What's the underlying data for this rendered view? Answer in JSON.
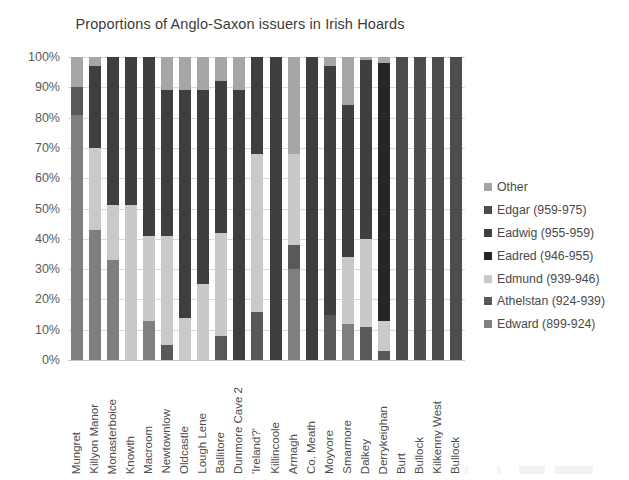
{
  "chart_data": {
    "type": "bar",
    "stacked": true,
    "normalized": "100%",
    "title": "Proportions of Anglo-Saxon issuers in Irish Hoards",
    "xlabel": "",
    "ylabel": "",
    "ylim": [
      0,
      100
    ],
    "ytick_labels": [
      "0%",
      "10%",
      "20%",
      "30%",
      "40%",
      "50%",
      "60%",
      "70%",
      "80%",
      "90%",
      "100%"
    ],
    "ytick_values": [
      0,
      10,
      20,
      30,
      40,
      50,
      60,
      70,
      80,
      90,
      100
    ],
    "grid": true,
    "legend_position": "right",
    "stack_order_bottom_to_top": [
      "Edward (899-924)",
      "Athelstan (924-939)",
      "Edmund (939-946)",
      "Eadred (946-955)",
      "Eadwig (955-959)",
      "Edgar (959-975)",
      "Other"
    ],
    "categories": [
      "Mungret",
      "Killyon Manor",
      "Monasterboice",
      "Knowth",
      "Macroom",
      "Newtownlow",
      "Oldcastle",
      "Lough Lene",
      "Ballitore",
      "Dunmore Cave 2",
      "'Ireland?'",
      "Killincoole",
      "Armagh",
      "Co. Meath",
      "Moyvore",
      "Smarmore",
      "Dalkey",
      "Derrykeighan",
      "Burt",
      "Bullock",
      "Kilkenny West",
      "Bullock"
    ],
    "categories_plotted": [
      "Mungret",
      "Killyon Manor",
      "Monasterboice",
      "Knowth",
      "Macroom",
      "Newtownlow",
      "Oldcastle",
      "Lough Lene",
      "Ballitore",
      "Dunmore Cave 2",
      "'Ireland?'",
      "Killincoole",
      "Armagh",
      "Co. Meath",
      "Moyvore",
      "Smarmore",
      "Dalkey",
      "Derrykeighan",
      "Burt",
      "Bullock",
      "Kilkenny West",
      "Bullock"
    ],
    "series": [
      {
        "name": "Edward (899-924)",
        "color": "#7f7f7f",
        "values": [
          81,
          43,
          33,
          0,
          13,
          0,
          0,
          0,
          0,
          0,
          0,
          0,
          30,
          0,
          0,
          12,
          0,
          0,
          0,
          0,
          0,
          0
        ]
      },
      {
        "name": "Athelstan (924-939)",
        "color": "#595959",
        "values": [
          9,
          0,
          0,
          0,
          0,
          5,
          0,
          0,
          8,
          0,
          16,
          0,
          8,
          0,
          15,
          0,
          11,
          3,
          0,
          0,
          0,
          0
        ]
      },
      {
        "name": "Edmund (939-946)",
        "color": "#c9c9c9",
        "values": [
          0,
          27,
          18,
          51,
          28,
          36,
          14,
          25,
          34,
          0,
          52,
          0,
          30,
          0,
          0,
          22,
          29,
          10,
          0,
          0,
          0,
          0
        ]
      },
      {
        "name": "Eadred (946-955)",
        "color": "#262626",
        "values": [
          0,
          0,
          0,
          0,
          0,
          0,
          0,
          0,
          0,
          0,
          0,
          0,
          0,
          0,
          0,
          0,
          0,
          85,
          0,
          0,
          0,
          0
        ]
      },
      {
        "name": "Eadwig (955-959)",
        "color": "#3f3f3f",
        "values": [
          0,
          27,
          49,
          49,
          59,
          48,
          75,
          64,
          50,
          89,
          32,
          100,
          0,
          100,
          82,
          50,
          59,
          0,
          0,
          0,
          0,
          0
        ]
      },
      {
        "name": "Edgar (959-975)",
        "color": "#4d4d4d",
        "values": [
          0,
          0,
          0,
          0,
          0,
          0,
          0,
          0,
          0,
          0,
          0,
          0,
          0,
          0,
          0,
          0,
          0,
          0,
          100,
          100,
          100,
          100
        ]
      },
      {
        "name": "Other",
        "color": "#a6a6a6",
        "values": [
          10,
          3,
          0,
          0,
          0,
          11,
          11,
          11,
          8,
          11,
          0,
          0,
          32,
          0,
          3,
          16,
          1,
          2,
          0,
          0,
          0,
          0
        ]
      }
    ]
  },
  "legend": {
    "items": [
      {
        "label": "Other",
        "color": "#a6a6a6"
      },
      {
        "label": "Edgar (959-975)",
        "color": "#4d4d4d"
      },
      {
        "label": "Eadwig (955-959)",
        "color": "#3f3f3f"
      },
      {
        "label": "Eadred (946-955)",
        "color": "#262626"
      },
      {
        "label": "Edmund (939-946)",
        "color": "#c9c9c9"
      },
      {
        "label": "Athelstan (924-939)",
        "color": "#595959"
      },
      {
        "label": "Edward (899-924)",
        "color": "#7f7f7f"
      }
    ]
  }
}
